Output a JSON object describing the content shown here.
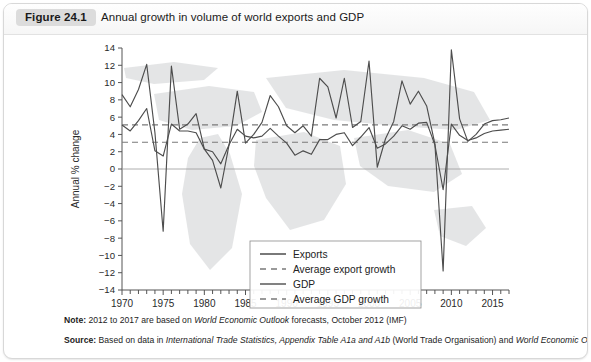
{
  "figure": {
    "badge": "Figure 24.1",
    "title": "Annual growth in volume of world exports and GDP"
  },
  "notes": {
    "note_label": "Note:",
    "note_text_1": " 2012 to 2017 are based on ",
    "note_italic_1": "World Economic Outlook",
    "note_text_2": " forecasts, October 2012 (IMF)",
    "source_label": "Source:",
    "source_text_1": " Based on data in ",
    "source_italic_1": "International Trade Statistics, Appendix Table A1a and A1b",
    "source_text_2": " (World Trade Organisation) and ",
    "source_italic_2": "World Economic Outlook",
    "source_text_3": " (IMF)"
  },
  "legend": {
    "items": [
      {
        "label": "Exports",
        "style": "solid",
        "color": "#4d4d4d"
      },
      {
        "label": "Average export growth",
        "style": "dashed",
        "color": "#7a7a7a"
      },
      {
        "label": "GDP",
        "style": "solid",
        "color": "#4d4d4d"
      },
      {
        "label": "Average GDP growth",
        "style": "dashed",
        "color": "#7a7a7a"
      }
    ]
  },
  "chart_data": {
    "type": "line",
    "title": "Annual growth in volume of world exports and GDP",
    "xlabel": "",
    "ylabel": "Annual % change",
    "xlim": [
      1970,
      2017
    ],
    "ylim": [
      -14,
      14
    ],
    "ytick_step": 2,
    "yticks": [
      14,
      12,
      10,
      8,
      6,
      4,
      2,
      0,
      -2,
      -4,
      -6,
      -8,
      -10,
      -12,
      -14
    ],
    "xticks": [
      1970,
      1975,
      1980,
      1985,
      1990,
      1995,
      2000,
      2005,
      2010,
      2015
    ],
    "xtick_minor_step": 1,
    "grid": false,
    "legend_position": "lower-right-inside",
    "x": [
      1970,
      1971,
      1972,
      1973,
      1974,
      1975,
      1976,
      1977,
      1978,
      1979,
      1980,
      1981,
      1982,
      1983,
      1984,
      1985,
      1986,
      1987,
      1988,
      1989,
      1990,
      1991,
      1992,
      1993,
      1994,
      1995,
      1996,
      1997,
      1998,
      1999,
      2000,
      2001,
      2002,
      2003,
      2004,
      2005,
      2006,
      2007,
      2008,
      2009,
      2010,
      2011,
      2012,
      2013,
      2014,
      2015,
      2016,
      2017
    ],
    "series": [
      {
        "name": "Exports",
        "color": "#4d4d4d",
        "style": "solid",
        "values": [
          8.6,
          7.2,
          9.2,
          12.1,
          4.2,
          -7.2,
          11.9,
          4.6,
          5.2,
          6.4,
          2.3,
          1.0,
          -2.2,
          2.8,
          9.0,
          3.0,
          4.0,
          5.4,
          8.5,
          7.2,
          5.0,
          4.2,
          5.0,
          3.8,
          10.5,
          9.5,
          5.9,
          10.5,
          4.8,
          5.5,
          12.5,
          0.2,
          3.5,
          5.5,
          10.2,
          7.5,
          9.0,
          7.3,
          2.9,
          -11.8,
          13.8,
          5.8,
          3.2,
          4.0,
          5.2,
          5.6,
          5.7,
          5.9
        ]
      },
      {
        "name": "GDP",
        "color": "#4d4d4d",
        "style": "solid",
        "values": [
          5.1,
          4.4,
          5.6,
          7.0,
          2.1,
          1.5,
          5.2,
          4.4,
          4.4,
          4.2,
          2.3,
          2.0,
          0.6,
          2.8,
          4.6,
          3.8,
          3.6,
          3.8,
          4.7,
          3.8,
          3.0,
          1.6,
          2.1,
          1.7,
          3.4,
          3.4,
          4.0,
          4.2,
          2.7,
          3.7,
          4.8,
          2.4,
          2.9,
          3.8,
          5.0,
          4.6,
          5.3,
          5.4,
          2.8,
          -2.4,
          5.2,
          3.9,
          3.3,
          3.6,
          4.1,
          4.4,
          4.5,
          4.6
        ]
      }
    ],
    "reference_lines": [
      {
        "name": "Average export growth",
        "value": 5.1,
        "style": "dashed",
        "color": "#7a7a7a"
      },
      {
        "name": "Average GDP growth",
        "value": 3.1,
        "style": "dashed",
        "color": "#7a7a7a"
      }
    ]
  }
}
